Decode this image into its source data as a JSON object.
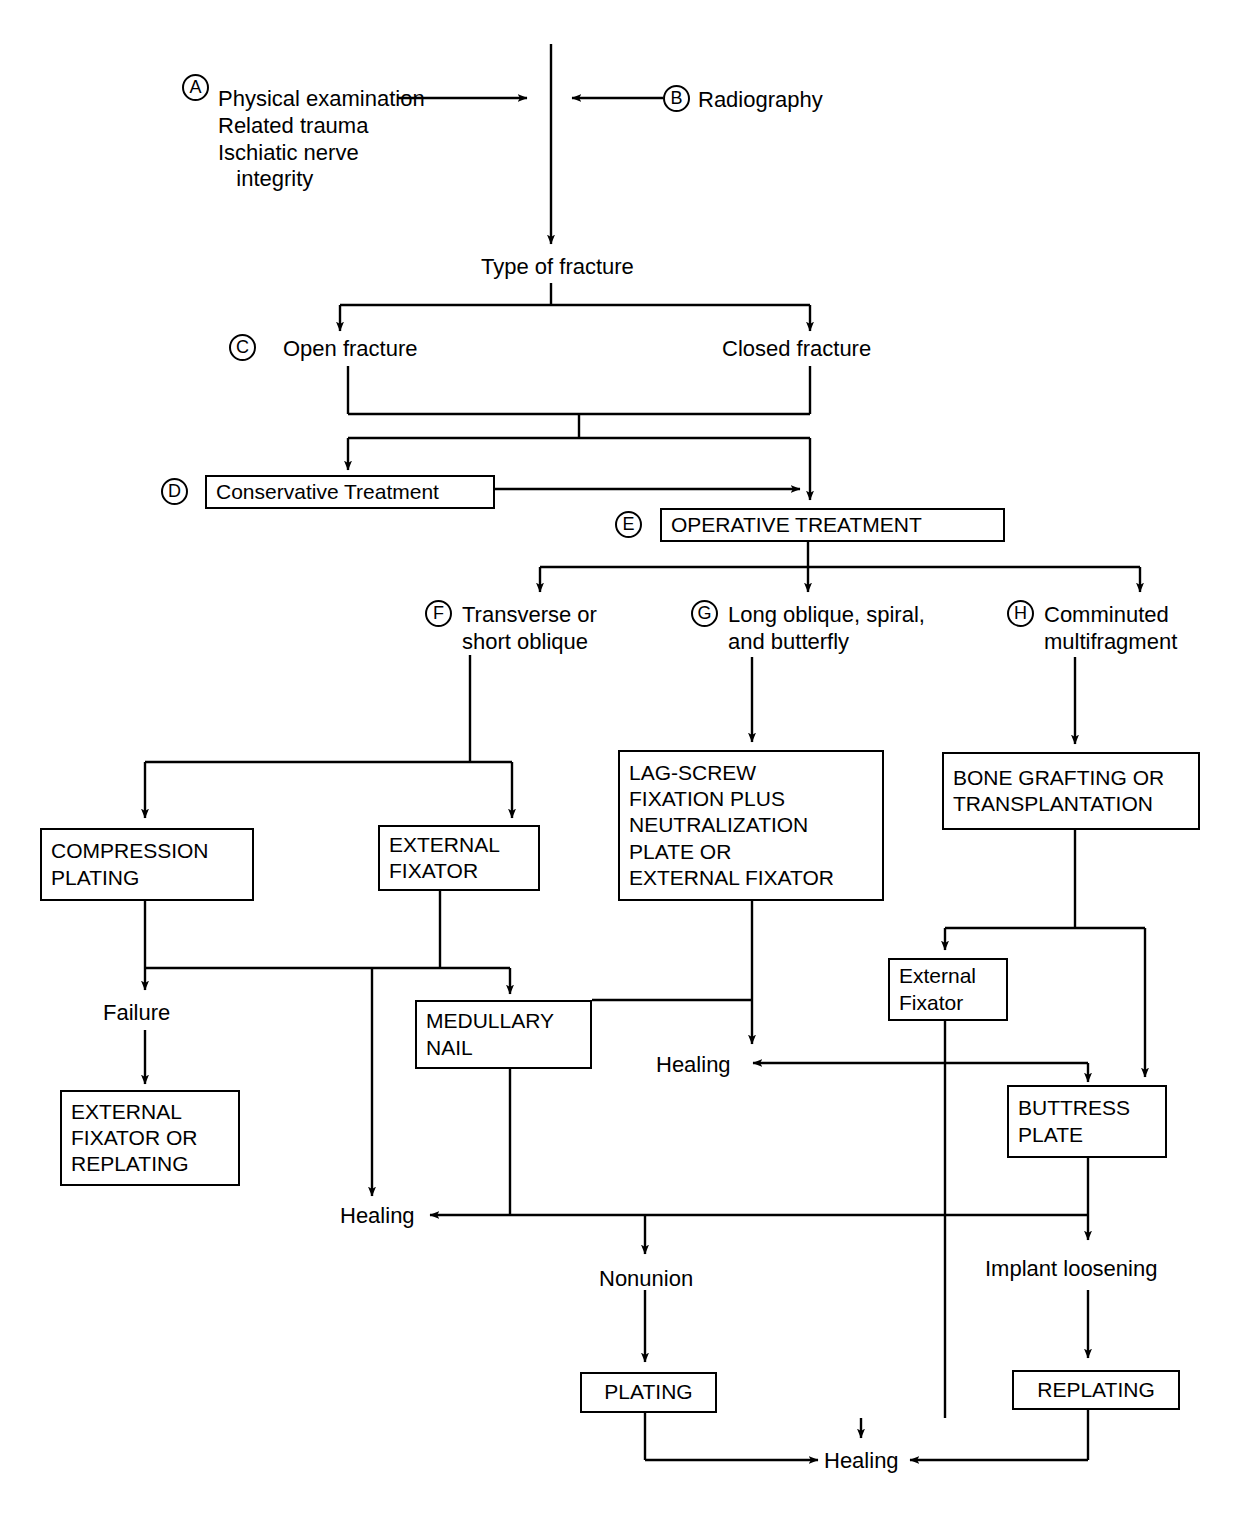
{
  "diagram": {
    "type": "flowchart",
    "nodes": {
      "a_label": "Physical examination\nRelated trauma\nIschiatic nerve\n   integrity",
      "a_key": "A",
      "b_label": "Radiography",
      "b_key": "B",
      "type_of_fracture": "Type of fracture",
      "c_key": "C",
      "open_fracture": "Open fracture",
      "closed_fracture": "Closed fracture",
      "d_key": "D",
      "conservative_treatment": "Conservative Treatment",
      "e_key": "E",
      "operative_treatment": "OPERATIVE TREATMENT",
      "f_key": "F",
      "f_label": "Transverse or\nshort oblique",
      "g_key": "G",
      "g_label": "Long oblique, spiral,\nand butterfly",
      "h_key": "H",
      "h_label": "Comminuted\nmultifragment",
      "compression_plating": "COMPRESSION\nPLATING",
      "external_fixator": "EXTERNAL\nFIXATOR",
      "lag_screw": "LAG-SCREW\nFIXATION PLUS\nNEUTRALIZATION\nPLATE OR\nEXTERNAL FIXATOR",
      "bone_grafting": "BONE GRAFTING OR\nTRANSPLANTATION",
      "failure": "Failure",
      "medullary_nail": "MEDULLARY\nNAIL",
      "healing_mid": "Healing",
      "external_fixator_2": "External\nFixator",
      "external_fixator_or_replating": "EXTERNAL\nFIXATOR OR\nREPLATING",
      "buttress_plate": "BUTTRESS\nPLATE",
      "healing_left": "Healing",
      "nonunion": "Nonunion",
      "implant_loosening": "Implant loosening",
      "plating": "PLATING",
      "replating": "REPLATING",
      "healing_bottom": "Healing"
    },
    "colors": {
      "ink": "#000000",
      "paper": "#ffffff"
    }
  }
}
